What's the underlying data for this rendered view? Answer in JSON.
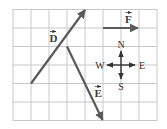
{
  "diagram": {
    "type": "vector-grid",
    "grid": {
      "columns": 8,
      "rows": 6,
      "line_color": "#c8c8c8"
    },
    "vectors": [
      {
        "name": "D",
        "label": "D",
        "from_cell": [
          1,
          4
        ],
        "to_cell": [
          4,
          0
        ],
        "label_pos": [
          53,
          41
        ]
      },
      {
        "name": "E",
        "label": "E",
        "from_cell": [
          3,
          2
        ],
        "to_cell": [
          5,
          6
        ],
        "label_pos": [
          98,
          94
        ]
      },
      {
        "name": "F",
        "label": "F",
        "from_cell": [
          5,
          1
        ],
        "to_cell": [
          7,
          1
        ],
        "label_pos": [
          128,
          22
        ]
      }
    ],
    "vector_color": "#5a5a5a",
    "compass": {
      "north": "N",
      "south": "S",
      "west": "W",
      "east": "E"
    }
  }
}
